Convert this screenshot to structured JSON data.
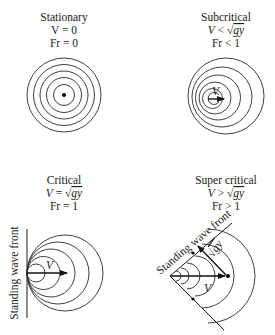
{
  "panels": [
    {
      "id": "stationary",
      "title": "Stationary",
      "velocity_label": "V = 0",
      "froude_label": "Fr = 0"
    },
    {
      "id": "subcritical",
      "title": "Subcritical",
      "velocity_label_prefix": "V",
      "velocity_label_op": " < ",
      "velocity_label_sqrt": "gy",
      "froude_label": "Fr < 1",
      "arrow_label": "V"
    },
    {
      "id": "critical",
      "title": "Critical",
      "velocity_label_prefix": "V",
      "velocity_label_op": " = ",
      "velocity_label_sqrt": "gy",
      "froude_label": "Fr = 1",
      "arrow_label": "V",
      "wavefront_label": "Standing wave front"
    },
    {
      "id": "supercritical",
      "title": "Super critical",
      "velocity_label_prefix": "V",
      "velocity_label_op": " > ",
      "velocity_label_sqrt": "gy",
      "froude_label": "Fr > 1",
      "arrow_label": "V",
      "wave_speed_label": "gy",
      "wavefront_label": "Standing wave front"
    }
  ]
}
